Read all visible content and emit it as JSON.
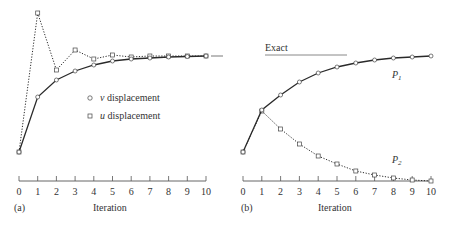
{
  "chart_data": [
    {
      "type": "line",
      "panel_label": "(a)",
      "xlabel": "Iteration",
      "ylabel": "",
      "x": [
        0,
        1,
        2,
        3,
        4,
        5,
        6,
        7,
        8,
        9,
        10
      ],
      "xlim": [
        0,
        10
      ],
      "grid": false,
      "legend_position": "center",
      "legend": [
        {
          "marker": "circle",
          "label": "v displacement",
          "var": "v",
          "rest": " displacement"
        },
        {
          "marker": "square",
          "label": "u displacement",
          "var": "u",
          "rest": " displacement"
        }
      ],
      "annotations": [
        "Exact value dash at right end"
      ],
      "series": [
        {
          "name": "v displacement",
          "style": "solid",
          "marker": "circle",
          "values_px": [
            152,
            97,
            80,
            71,
            65,
            61,
            59,
            58,
            57,
            56.5,
            56
          ],
          "values_rel": [
            0.0,
            0.57,
            0.75,
            0.84,
            0.9,
            0.95,
            0.97,
            0.98,
            0.99,
            1.0,
            1.0
          ]
        },
        {
          "name": "u displacement",
          "style": "dotted",
          "marker": "square",
          "values_px": [
            152,
            13,
            70,
            50,
            59,
            55,
            57,
            56,
            56,
            56,
            56
          ],
          "values_rel": [
            0.0,
            1.45,
            0.85,
            1.06,
            0.97,
            1.01,
            0.99,
            1.0,
            1.0,
            1.0,
            1.0
          ]
        }
      ],
      "exact_px": 56
    },
    {
      "type": "line",
      "panel_label": "(b)",
      "xlabel": "Iteration",
      "ylabel": "",
      "x": [
        0,
        1,
        2,
        3,
        4,
        5,
        6,
        7,
        8,
        9,
        10
      ],
      "xlim": [
        0,
        10
      ],
      "grid": false,
      "legend": [
        {
          "label": "Exact",
          "style": "solid line"
        }
      ],
      "annotations": [
        "P1",
        "P2"
      ],
      "series": [
        {
          "name": "P1",
          "style": "solid",
          "marker": "circle",
          "values_px": [
            152,
            110,
            95,
            82,
            73,
            67,
            63,
            60,
            58,
            57,
            56
          ],
          "values_rel": [
            0.0,
            0.44,
            0.59,
            0.73,
            0.82,
            0.89,
            0.93,
            0.96,
            0.98,
            0.99,
            1.0
          ]
        },
        {
          "name": "P2",
          "style": "dotted",
          "marker": "square",
          "values_px": [
            152,
            111,
            129,
            144,
            156,
            164,
            171,
            175,
            178,
            180,
            181
          ],
          "values_rel": [
            1.0,
            1.35,
            1.18,
            0.93,
            0.83,
            0.71,
            0.57,
            0.42,
            0.28,
            0.13,
            0.0
          ]
        }
      ],
      "exact_px": 55
    }
  ],
  "panels": {
    "a": {
      "label": "(a)",
      "xlabel": "Iteration",
      "ticks": [
        "0",
        "1",
        "2",
        "3",
        "4",
        "5",
        "6",
        "7",
        "8",
        "9",
        "10"
      ],
      "legend_v_var": "v",
      "legend_v_rest": " displacement",
      "legend_u_var": "u",
      "legend_u_rest": " displacement"
    },
    "b": {
      "label": "(b)",
      "xlabel": "Iteration",
      "ticks": [
        "0",
        "1",
        "2",
        "3",
        "4",
        "5",
        "6",
        "7",
        "8",
        "9",
        "10"
      ],
      "exact_label": "Exact",
      "p1_var": "P",
      "p1_sub": "1",
      "p2_var": "P",
      "p2_sub": "2"
    }
  },
  "colors": {
    "line": "#2a2a2a",
    "marker_fill": "#ffffff",
    "axis": "#555555",
    "exact_line": "#888888"
  }
}
